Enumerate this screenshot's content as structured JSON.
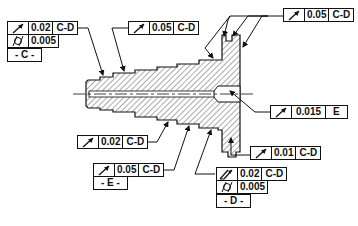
{
  "drawing": {
    "description": "Stepped shaft with flange, cross-section view with runout tolerance callouts",
    "line_color": "#111111",
    "hatch_color": "#555555",
    "background": "#ffffff"
  },
  "callouts": [
    {
      "id": "fcf-c",
      "rows": [
        {
          "symbol": "circular-runout",
          "value": "0.02",
          "datum": "C-D"
        },
        {
          "symbol": "cylindricity",
          "value": "0.005"
        },
        {
          "datum_label": "- C -"
        }
      ]
    },
    {
      "id": "fcf-top-mid",
      "rows": [
        {
          "symbol": "circular-runout",
          "value": "0.05",
          "datum": "C-D"
        }
      ]
    },
    {
      "id": "fcf-top-right",
      "rows": [
        {
          "symbol": "circular-runout",
          "value": "0.05",
          "datum": "C-D"
        }
      ]
    },
    {
      "id": "fcf-bore",
      "rows": [
        {
          "symbol": "circular-runout",
          "value": "0.015",
          "datum": "E"
        }
      ]
    },
    {
      "id": "fcf-face",
      "rows": [
        {
          "symbol": "circular-runout",
          "value": "0.01",
          "datum": "C-D"
        }
      ]
    },
    {
      "id": "fcf-step",
      "rows": [
        {
          "symbol": "circular-runout",
          "value": "0.02",
          "datum": "C-D"
        }
      ]
    },
    {
      "id": "fcf-e",
      "rows": [
        {
          "symbol": "circular-runout",
          "value": "0.05",
          "datum": "C-D"
        },
        {
          "datum_label": "- E -"
        }
      ]
    },
    {
      "id": "fcf-d",
      "rows": [
        {
          "symbol": "total-runout",
          "value": "0.02",
          "datum": "C-D"
        },
        {
          "symbol": "cylindricity",
          "value": "0.005"
        },
        {
          "datum_label": "- D -"
        }
      ]
    }
  ]
}
